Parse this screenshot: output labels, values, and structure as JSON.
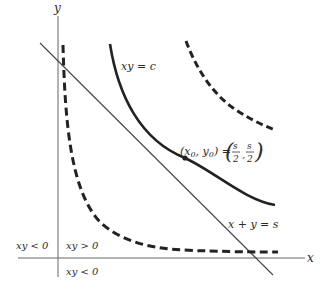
{
  "axes": {
    "x_label": "x",
    "y_label": "y"
  },
  "curves": {
    "hyperbola_label": "xy = c",
    "line_label": "x + y = s"
  },
  "point": {
    "label_lhs": "(x",
    "sub0": "0",
    "comma": ", y",
    "sub1": "0",
    "rhs_open": ") =",
    "frac_num": "s",
    "frac_den": "2"
  },
  "regions": {
    "q2": "xy < 0",
    "q1": "xy > 0",
    "q4": "xy < 0"
  },
  "colors": {
    "curve": "#222222",
    "axis": "#555555",
    "line": "#444444"
  }
}
